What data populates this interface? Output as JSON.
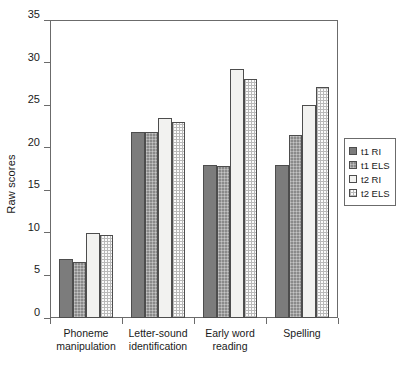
{
  "chart_data": {
    "type": "bar",
    "title": "",
    "xlabel": "",
    "ylabel": "Raw scores",
    "ylim": [
      0,
      35
    ],
    "ytick_values": [
      0,
      5,
      10,
      15,
      20,
      25,
      30,
      35
    ],
    "ytick_labels": [
      "0",
      "5",
      "10",
      "15",
      "20",
      "25",
      "30",
      "35"
    ],
    "grid": false,
    "legend_position": "right",
    "categories": [
      "Phoneme\nmanipulation",
      "Letter-sound\nidentification",
      "Early word\nreading",
      "Spelling"
    ],
    "series": [
      {
        "name": "t1 RI",
        "values": [
          6.9,
          21.9,
          18.0,
          18.0
        ]
      },
      {
        "name": "t1 ELS",
        "values": [
          6.6,
          21.8,
          17.8,
          21.5
        ]
      },
      {
        "name": "t2 RI",
        "values": [
          10.0,
          23.5,
          29.2,
          25.0
        ]
      },
      {
        "name": "t2 ELS",
        "values": [
          9.8,
          23.0,
          28.1,
          27.1
        ]
      }
    ]
  },
  "legend": {
    "entries": [
      {
        "label": "t1 RI"
      },
      {
        "label": "t1 ELS"
      },
      {
        "label": "t2 RI"
      },
      {
        "label": "t2 ELS"
      }
    ]
  },
  "colors": {
    "t1_ri": "#7c7c7c",
    "t1_els": "#8a8a8a",
    "t2_ri": "#f2f2f0",
    "t2_els": "#fbfbfb",
    "axis": "#6b6b6b",
    "text": "#1a1a1a"
  }
}
